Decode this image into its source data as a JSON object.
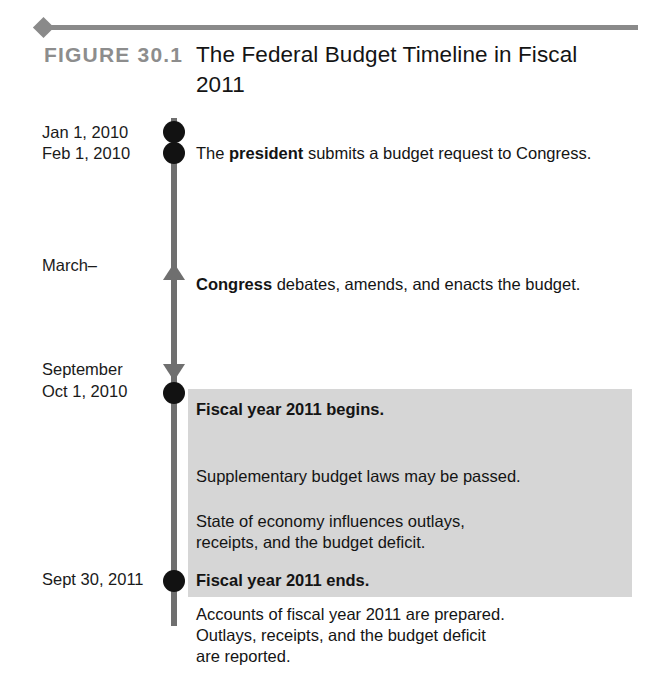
{
  "figure": {
    "label": "FIGURE 30.1",
    "title": "The Federal Budget Timeline in Fiscal 2011",
    "rule_color": "#8a8a8a",
    "label_color": "#8d8d8d"
  },
  "timeline": {
    "line_color": "#6f6f6f",
    "dot_color": "#121212",
    "shade_color": "#d6d6d6",
    "dates": [
      {
        "id": "jan-1-2010",
        "text": "Jan 1, 2010"
      },
      {
        "id": "feb-1-2010",
        "text": "Feb 1, 2010"
      },
      {
        "id": "march",
        "text": "March–"
      },
      {
        "id": "september",
        "text": "September"
      },
      {
        "id": "oct-1-2010",
        "text": "Oct 1, 2010"
      },
      {
        "id": "sept-30-2011",
        "text": "Sept 30, 2011"
      }
    ]
  },
  "events": {
    "president": {
      "prefix": "The ",
      "bold": "president",
      "suffix": " submits a budget request to Congress."
    },
    "congress": {
      "bold": "Congress",
      "suffix": " debates, amends, and enacts the budget."
    },
    "fy_begins": "Fiscal year 2011 begins.",
    "supplementary": "Supplementary budget laws may be passed.",
    "economy": "State of economy influences outlays,\nreceipts, and the budget deficit.",
    "fy_ends": "Fiscal year 2011 ends.",
    "accounts": "Accounts of fiscal year 2011 are prepared.\nOutlays, receipts, and the budget deficit\nare reported."
  }
}
